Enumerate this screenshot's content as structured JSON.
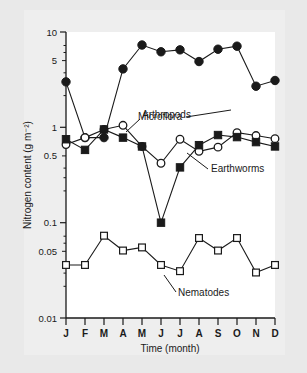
{
  "figure": {
    "background_color": "#e9e9e9",
    "plot_background_color": "#ffffff",
    "ink_color": "#1a1a1a"
  },
  "chart_data": {
    "type": "line",
    "title": "",
    "xlabel": "Time (month)",
    "ylabel": "Nitrogen content (g m⁻²)",
    "x_categories": [
      "J",
      "F",
      "M",
      "A",
      "M",
      "J",
      "J",
      "A",
      "S",
      "O",
      "N",
      "D"
    ],
    "yscale": "log",
    "ylim": [
      0.01,
      10
    ],
    "y_tick_labels": [
      "10",
      "5",
      "1",
      "0.5",
      "0.1",
      "0.05",
      "0.01"
    ],
    "y_tick_values": [
      10,
      5,
      1,
      0.5,
      0.1,
      0.05,
      0.01
    ],
    "grid": false,
    "legend": "inline-annotations",
    "series": [
      {
        "name": "Microflora",
        "marker": "filled-circle",
        "values": [
          3.0,
          0.78,
          0.78,
          4.1,
          7.3,
          6.2,
          6.5,
          4.9,
          6.6,
          7.1,
          2.7,
          3.1
        ]
      },
      {
        "name": "Arthropods",
        "marker": "open-circle",
        "values": [
          0.66,
          0.78,
          0.95,
          1.05,
          0.63,
          0.42,
          0.75,
          0.56,
          0.62,
          0.88,
          0.82,
          0.76
        ]
      },
      {
        "name": "Earthworms",
        "marker": "filled-square",
        "values": [
          0.75,
          0.58,
          0.95,
          0.78,
          0.63,
          0.1,
          0.38,
          0.65,
          0.83,
          0.79,
          0.7,
          0.63
        ]
      },
      {
        "name": "Nematodes",
        "marker": "open-square",
        "values": [
          0.036,
          0.036,
          0.073,
          0.051,
          0.055,
          0.036,
          0.031,
          0.069,
          0.051,
          0.069,
          0.03,
          0.036
        ]
      }
    ],
    "annotations": [
      {
        "label": "Microflora",
        "series": "Microflora"
      },
      {
        "label": "Arthropods",
        "series": "Arthropods"
      },
      {
        "label": "Earthworms",
        "series": "Earthworms"
      },
      {
        "label": "Nematodes",
        "series": "Nematodes"
      }
    ]
  }
}
